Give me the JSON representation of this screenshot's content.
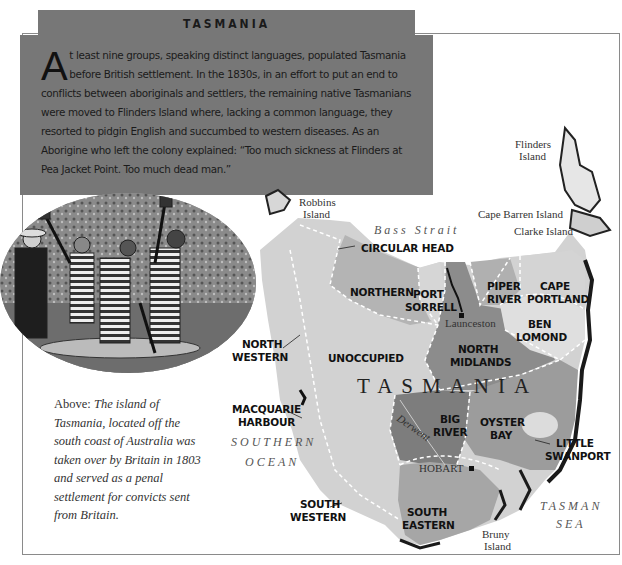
{
  "header": {
    "title": "TASMANIA"
  },
  "intro": {
    "dropcap": "A",
    "text": "t least nine groups, speaking distinct languages, populated Tasmania before British settlement. In the 1830s, in an effort to put an end to conflicts between aboriginals and settlers, the remaining native Tasmanians were moved to Flinders Island where, lacking a common language, they resorted to pidgin English and succumbed to western diseases. As an Aborigine who left the colony explained: “Too much sickness at Flinders at Pea Jacket Point. Too much dead man.”"
  },
  "illustration": {
    "subject": "convicts-in-striped-uniforms-chopping-logs"
  },
  "caption": {
    "lead": "Above: ",
    "text": "The island of Tasmania, located off the south coast of Australia was taken over by Britain in 1803 and served as a penal settlement for convicts sent from Britain."
  },
  "map": {
    "main_label": "TASMANIA",
    "colors": {
      "light": "#d2d2d2",
      "mid": "#b4b4b4",
      "dark": "#8c8c8c",
      "darker": "#7a7a7a",
      "boundary": "#ffffff"
    },
    "regions": {
      "circular_head": "CIRCULAR HEAD",
      "northern": "NORTHERN",
      "port_sorrell_1": "PORT",
      "port_sorrell_2": "SORRELL",
      "piper_river_1": "PIPER",
      "piper_river_2": "RIVER",
      "cape_portland_1": "CAPE",
      "cape_portland_2": "PORTLAND",
      "ben_lomond_1": "BEN",
      "ben_lomond_2": "LOMOND",
      "north_western_1": "NORTH",
      "north_western_2": "WESTERN",
      "unoccupied": "UNOCCUPIED",
      "north_midlands_1": "NORTH",
      "north_midlands_2": "MIDLANDS",
      "macquarie_1": "MACQUARIE",
      "macquarie_2": "HARBOUR",
      "big_river_1": "BIG",
      "big_river_2": "RIVER",
      "oyster_bay_1": "OYSTER",
      "oyster_bay_2": "BAY",
      "little_swanport_1": "LITTLE",
      "little_swanport_2": "SWANPORT",
      "south_western_1": "SOUTH",
      "south_western_2": "WESTERN",
      "south_eastern_1": "SOUTH",
      "south_eastern_2": "EASTERN"
    },
    "places": {
      "launceston": "Launceston",
      "hobart": "HOBART",
      "derwent": "Derwent",
      "robbins_1": "Robbins",
      "robbins_2": "Island",
      "flinders_1": "Flinders",
      "flinders_2": "Island",
      "cape_barren": "Cape Barren Island",
      "clarke": "Clarke Island",
      "bruny_1": "Bruny",
      "bruny_2": "Island"
    },
    "seas": {
      "bass_strait": "Bass  Strait",
      "southern_1": "SOUTHERN",
      "southern_2": "OCEAN",
      "tasman_1": "TASMAN",
      "tasman_2": "SEA"
    }
  }
}
